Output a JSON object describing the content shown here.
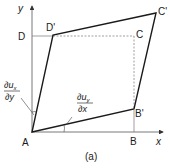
{
  "figure": {
    "caption": "(a)",
    "axes": {
      "x_label": "x",
      "y_label": "y"
    },
    "points": {
      "A": "A",
      "B": "B",
      "B_prime": "B'",
      "C": "C",
      "C_prime": "C'",
      "D": "D",
      "D_prime": "D'"
    },
    "angle_labels": {
      "shear_x": {
        "numerator": "∂u",
        "numerator_sub": "x",
        "denominator": "∂y"
      },
      "shear_y": {
        "numerator": "∂u",
        "numerator_sub": "y",
        "denominator": "∂x"
      }
    },
    "colors": {
      "line": "#1a1a1a",
      "axis": "#555555",
      "dashed": "#777777",
      "background": "#ffffff"
    }
  }
}
